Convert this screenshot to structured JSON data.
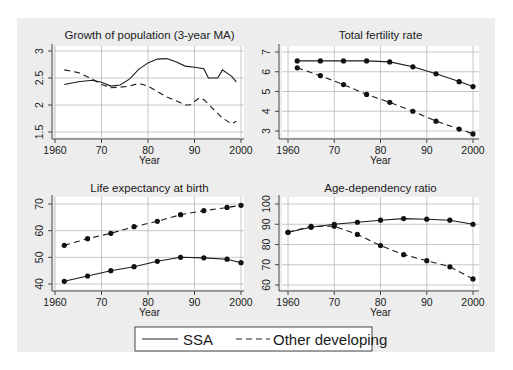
{
  "figure": {
    "legend": {
      "items": [
        {
          "label": "SSA",
          "style": "solid"
        },
        {
          "label": "Other developing",
          "style": "dashed"
        }
      ]
    }
  },
  "chart_data": [
    {
      "type": "line",
      "title": "Growth of population (3-year MA)",
      "xlabel": "Year",
      "ylabel": "",
      "xticks": [
        "1960",
        "70",
        "80",
        "90",
        "2000"
      ],
      "yticks": [
        "1.5",
        "2",
        "2.5",
        "3"
      ],
      "xlim": [
        1960,
        2000
      ],
      "ylim": [
        1.45,
        3.05
      ],
      "grid": true,
      "series": [
        {
          "name": "SSA",
          "style": "solid",
          "x": [
            1962,
            1965,
            1968,
            1970,
            1972,
            1974,
            1976,
            1978,
            1980,
            1982,
            1984,
            1986,
            1988,
            1990,
            1992,
            1993,
            1995,
            1996,
            1998,
            1999
          ],
          "values": [
            2.38,
            2.43,
            2.46,
            2.42,
            2.35,
            2.37,
            2.48,
            2.66,
            2.78,
            2.85,
            2.86,
            2.8,
            2.72,
            2.7,
            2.67,
            2.5,
            2.5,
            2.65,
            2.53,
            2.43
          ]
        },
        {
          "name": "Other developing",
          "style": "dashed",
          "x": [
            1962,
            1965,
            1968,
            1970,
            1972,
            1974,
            1976,
            1978,
            1980,
            1982,
            1984,
            1986,
            1988,
            1989,
            1991,
            1992,
            1994,
            1996,
            1998,
            1999
          ],
          "values": [
            2.65,
            2.6,
            2.48,
            2.38,
            2.32,
            2.33,
            2.35,
            2.4,
            2.35,
            2.25,
            2.15,
            2.08,
            2.0,
            2.0,
            2.13,
            2.1,
            1.93,
            1.76,
            1.65,
            1.7
          ]
        }
      ]
    },
    {
      "type": "line",
      "title": "Total fertility rate",
      "xlabel": "Year",
      "ylabel": "",
      "xticks": [
        "1960",
        "70",
        "80",
        "90",
        "2000"
      ],
      "yticks": [
        "3",
        "4",
        "5",
        "6",
        "7"
      ],
      "xlim": [
        1960,
        2000
      ],
      "ylim": [
        2.7,
        7.2
      ],
      "grid": true,
      "markers": true,
      "series": [
        {
          "name": "SSA",
          "style": "solid",
          "x": [
            1962,
            1967,
            1972,
            1977,
            1982,
            1987,
            1992,
            1997,
            2000
          ],
          "values": [
            6.55,
            6.55,
            6.55,
            6.55,
            6.5,
            6.25,
            5.9,
            5.5,
            5.25
          ]
        },
        {
          "name": "Other developing",
          "style": "dashed",
          "x": [
            1962,
            1967,
            1972,
            1977,
            1982,
            1987,
            1992,
            1997,
            2000
          ],
          "values": [
            6.2,
            5.8,
            5.35,
            4.85,
            4.45,
            4.0,
            3.5,
            3.1,
            2.85
          ]
        }
      ]
    },
    {
      "type": "line",
      "title": "Life expectancy at birth",
      "xlabel": "Year",
      "ylabel": "",
      "xticks": [
        "1960",
        "70",
        "80",
        "90",
        "2000"
      ],
      "yticks": [
        "40",
        "50",
        "60",
        "70"
      ],
      "xlim": [
        1960,
        2000
      ],
      "ylim": [
        39,
        71.5
      ],
      "grid": true,
      "markers": true,
      "series": [
        {
          "name": "SSA",
          "style": "solid",
          "x": [
            1962,
            1967,
            1972,
            1977,
            1982,
            1987,
            1992,
            1997,
            2000
          ],
          "values": [
            41,
            43,
            45,
            46.5,
            48.5,
            50,
            49.8,
            49.3,
            48
          ]
        },
        {
          "name": "Other developing",
          "style": "dashed",
          "x": [
            1962,
            1967,
            1972,
            1977,
            1982,
            1987,
            1992,
            1997,
            2000
          ],
          "values": [
            54.5,
            57,
            59,
            61.5,
            63.5,
            66,
            67.5,
            68.7,
            69.5
          ]
        }
      ]
    },
    {
      "type": "line",
      "title": "Age-dependency ratio",
      "xlabel": "Year",
      "ylabel": "",
      "xticks": [
        "1960",
        "70",
        "80",
        "90",
        "2000"
      ],
      "yticks": [
        "60",
        "70",
        "80",
        "90",
        "100"
      ],
      "xlim": [
        1960,
        2000
      ],
      "ylim": [
        58,
        102
      ],
      "grid": true,
      "markers": true,
      "series": [
        {
          "name": "SSA",
          "style": "solid",
          "x": [
            1960,
            1965,
            1970,
            1975,
            1980,
            1985,
            1990,
            1995,
            2000
          ],
          "values": [
            86,
            88.5,
            90,
            91,
            92,
            92.8,
            92.5,
            92,
            90
          ]
        },
        {
          "name": "Other developing",
          "style": "dashed",
          "x": [
            1960,
            1965,
            1970,
            1975,
            1980,
            1985,
            1990,
            1995,
            2000
          ],
          "values": [
            86,
            89,
            89,
            85,
            79.5,
            75,
            72,
            69,
            63
          ]
        }
      ]
    }
  ]
}
